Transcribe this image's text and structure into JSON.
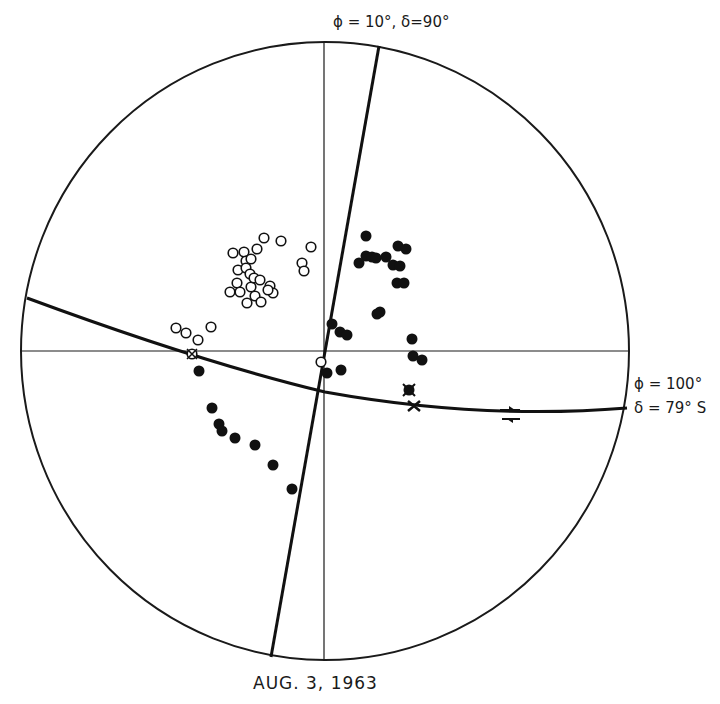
{
  "title": "AUG. 3, 1963",
  "labels": {
    "plane1": "ϕ = 10°,  δ=90°",
    "plane2_strike": "ϕ = 100°",
    "plane2_dip": "δ = 79° S"
  },
  "net": {
    "cx": 325,
    "cy": 351,
    "rx": 304,
    "ry": 309,
    "stroke": "#1a1a1a"
  },
  "open_circles": [
    [
      176,
      328
    ],
    [
      186,
      333
    ],
    [
      198,
      340
    ],
    [
      211,
      327
    ],
    [
      233,
      253
    ],
    [
      244,
      252
    ],
    [
      246,
      261
    ],
    [
      251,
      259
    ],
    [
      257,
      249
    ],
    [
      264,
      238
    ],
    [
      281,
      241
    ],
    [
      311,
      247
    ],
    [
      302,
      263
    ],
    [
      304,
      271
    ],
    [
      238,
      270
    ],
    [
      246,
      268
    ],
    [
      250,
      274
    ],
    [
      237,
      283
    ],
    [
      230,
      292
    ],
    [
      240,
      292
    ],
    [
      251,
      287
    ],
    [
      255,
      296
    ],
    [
      261,
      302
    ],
    [
      247,
      303
    ],
    [
      270,
      286
    ],
    [
      273,
      293
    ],
    [
      268,
      290
    ],
    [
      254,
      278
    ],
    [
      260,
      280
    ],
    [
      192,
      354
    ],
    [
      321,
      362
    ]
  ],
  "filled_circles": [
    [
      366,
      236
    ],
    [
      366,
      256
    ],
    [
      372,
      257
    ],
    [
      359,
      263
    ],
    [
      376,
      258
    ],
    [
      386,
      257
    ],
    [
      393,
      265
    ],
    [
      400,
      266
    ],
    [
      398,
      246
    ],
    [
      406,
      249
    ],
    [
      397,
      283
    ],
    [
      404,
      283
    ],
    [
      377,
      314
    ],
    [
      380,
      312
    ],
    [
      332,
      324
    ],
    [
      340,
      332
    ],
    [
      347,
      335
    ],
    [
      412,
      339
    ],
    [
      413,
      356
    ],
    [
      422,
      360
    ],
    [
      327,
      373
    ],
    [
      341,
      370
    ],
    [
      199,
      371
    ],
    [
      212,
      408
    ],
    [
      219,
      424
    ],
    [
      222,
      431
    ],
    [
      235,
      438
    ],
    [
      255,
      445
    ],
    [
      273,
      465
    ],
    [
      292,
      489
    ]
  ],
  "special_symbols": [
    [
      409,
      390
    ],
    [
      414,
      406
    ]
  ],
  "slip_arrow": {
    "x": 510,
    "y": 413
  }
}
